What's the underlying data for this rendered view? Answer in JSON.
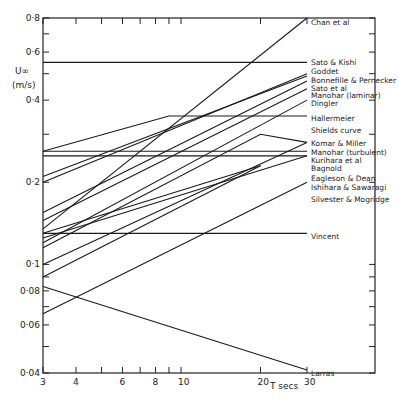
{
  "chart_data": {
    "type": "line",
    "title": "",
    "xlabel": "T secs",
    "ylabel": "U∞ (m/s)",
    "xscale": "log",
    "yscale": "log",
    "xlim": [
      3,
      30
    ],
    "ylim": [
      0.04,
      0.8
    ],
    "x_ticks": [
      "3",
      "4",
      "6",
      "8",
      "10",
      "20",
      "30"
    ],
    "y_ticks": [
      "0·04",
      "0·06",
      "0·08",
      "0·1",
      "0·2",
      "0·4",
      "0·6",
      "0·8"
    ],
    "grid": false,
    "series": [
      {
        "name": "Chan et al",
        "x": [
          3,
          30
        ],
        "values": [
          0.135,
          0.8
        ]
      },
      {
        "name": "Sato & Kishi",
        "x": [
          3,
          30
        ],
        "values": [
          0.55,
          0.55
        ]
      },
      {
        "name": "Goddet",
        "x": [
          3,
          30
        ],
        "values": [
          0.2,
          0.5
        ]
      },
      {
        "name": "Bonnefille & Pernecker",
        "x": [
          3,
          30
        ],
        "values": [
          0.21,
          0.49
        ]
      },
      {
        "name": "Sato et al",
        "x": [
          3,
          30
        ],
        "values": [
          0.155,
          0.47
        ]
      },
      {
        "name": "Manohar (laminar)",
        "x": [
          3,
          30
        ],
        "values": [
          0.145,
          0.44
        ]
      },
      {
        "name": "Dingler",
        "x": [
          3,
          30
        ],
        "values": [
          0.12,
          0.4
        ]
      },
      {
        "name": "Hallermeier",
        "x": [
          3,
          9,
          30
        ],
        "values": [
          0.26,
          0.35,
          0.35
        ]
      },
      {
        "name": "Shields curve",
        "x": [
          3,
          20,
          30
        ],
        "values": [
          0.115,
          0.3,
          0.28
        ]
      },
      {
        "name": "Komar & Miller",
        "x": [
          3,
          30
        ],
        "values": [
          0.1,
          0.28
        ]
      },
      {
        "name": "Manohar (turbulent)",
        "x": [
          3,
          30
        ],
        "values": [
          0.26,
          0.26
        ]
      },
      {
        "name": "Kurihara et al",
        "x": [
          3,
          30
        ],
        "values": [
          0.25,
          0.25
        ]
      },
      {
        "name": "Bagnold",
        "x": [
          3,
          30
        ],
        "values": [
          0.125,
          0.25
        ]
      },
      {
        "name": "Eagleson & Dean",
        "x": [
          3,
          20
        ],
        "values": [
          0.13,
          0.23
        ]
      },
      {
        "name": "Ishihara & Sawaragi",
        "x": [
          3,
          20
        ],
        "values": [
          0.09,
          0.23
        ]
      },
      {
        "name": "Silvester & Mogridge",
        "x": [
          3,
          30
        ],
        "values": [
          0.066,
          0.2
        ]
      },
      {
        "name": "Vincent",
        "x": [
          3,
          30
        ],
        "values": [
          0.13,
          0.13
        ]
      },
      {
        "name": "Larras",
        "x": [
          3,
          30
        ],
        "values": [
          0.083,
          0.041
        ]
      }
    ]
  },
  "axes": {
    "y_label_top": "U∞",
    "y_label_bottom": "(m/s)",
    "x_label": "T secs"
  }
}
